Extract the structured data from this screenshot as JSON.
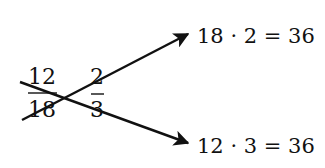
{
  "diagram": {
    "type": "cross-multiplication",
    "colors": {
      "ink": "#111111",
      "background": "#ffffff"
    },
    "fraction_left": {
      "numerator": "12",
      "denominator": "18"
    },
    "fraction_right": {
      "numerator": "2",
      "denominator": "3"
    },
    "result_top": "18 · 2 = 36",
    "result_bottom": "12 · 3 = 36",
    "arrows": [
      {
        "name": "arrow-denominator-left-to-numerator-right",
        "from": "18",
        "to": "2",
        "label_ref": "result_top"
      },
      {
        "name": "arrow-numerator-left-to-denominator-right",
        "from": "12",
        "to": "3",
        "label_ref": "result_bottom"
      }
    ]
  }
}
